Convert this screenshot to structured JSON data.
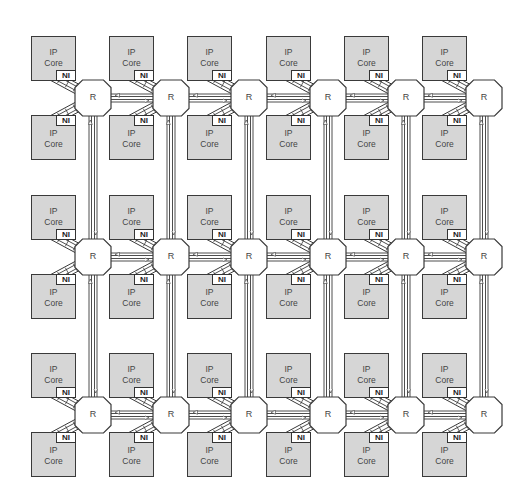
{
  "diagram": {
    "title": "",
    "type": "2D mesh Network-on-Chip",
    "grid": {
      "rows": 3,
      "cols": 6
    },
    "router_label": "R",
    "core_label_line1": "IP",
    "core_label_line2": "Core",
    "ni_label": "NI",
    "router_centers_x": [
      93,
      171,
      249,
      328,
      406,
      484
    ],
    "router_centers_y": [
      98,
      257,
      415
    ],
    "colors": {
      "core_fill": "#d6d6d6",
      "stroke": "#3a3a3a",
      "router_fill": "#ffffff",
      "ni_fill": "#ffffff"
    }
  },
  "routers": [
    {
      "label": "R",
      "row": 0,
      "col": 0
    },
    {
      "label": "R",
      "row": 0,
      "col": 1
    },
    {
      "label": "R",
      "row": 0,
      "col": 2
    },
    {
      "label": "R",
      "row": 0,
      "col": 3
    },
    {
      "label": "R",
      "row": 0,
      "col": 4
    },
    {
      "label": "R",
      "row": 0,
      "col": 5
    },
    {
      "label": "R",
      "row": 1,
      "col": 0
    },
    {
      "label": "R",
      "row": 1,
      "col": 1
    },
    {
      "label": "R",
      "row": 1,
      "col": 2
    },
    {
      "label": "R",
      "row": 1,
      "col": 3
    },
    {
      "label": "R",
      "row": 1,
      "col": 4
    },
    {
      "label": "R",
      "row": 1,
      "col": 5
    },
    {
      "label": "R",
      "row": 2,
      "col": 0
    },
    {
      "label": "R",
      "row": 2,
      "col": 1
    },
    {
      "label": "R",
      "row": 2,
      "col": 2
    },
    {
      "label": "R",
      "row": 2,
      "col": 3
    },
    {
      "label": "R",
      "row": 2,
      "col": 4
    },
    {
      "label": "R",
      "row": 2,
      "col": 5
    }
  ],
  "cores_per_router": [
    {
      "position": "top-left",
      "label": "IP Core",
      "ni": "NI"
    },
    {
      "position": "bottom-left",
      "label": "IP Core",
      "ni": "NI"
    }
  ],
  "links": {
    "horizontal": "bidirectional between adjacent routers in each row",
    "vertical": "bidirectional between adjacent routers in each column",
    "router_to_ni": "bidirectional diagonal connector"
  }
}
